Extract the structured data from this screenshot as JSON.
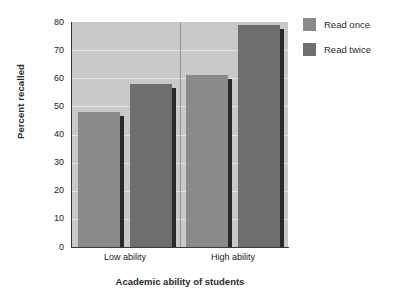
{
  "chart_data": {
    "type": "bar",
    "title": "",
    "subtitle": "",
    "xlabel": "Academic ability of students",
    "ylabel": "Percent recalled",
    "categories": [
      "Low ability",
      "High ability"
    ],
    "series": [
      {
        "name": "Read once",
        "values": [
          48,
          61
        ],
        "color": "#8a8a8a"
      },
      {
        "name": "Read twice",
        "values": [
          58,
          79
        ],
        "color": "#6e6e6e"
      }
    ],
    "ylim": [
      0,
      80
    ],
    "ytick_values": [
      0,
      10,
      20,
      30,
      40,
      50,
      60,
      70,
      80
    ],
    "ytick_labels": [
      "0",
      "10",
      "20",
      "30",
      "40",
      "50",
      "60",
      "70",
      "80"
    ],
    "grid": true,
    "grid_axis": "y",
    "legend_position": "right",
    "plot_background": "#c9c9c9",
    "gridline_color": "#e6e6e6",
    "axis_color": "#3a3a3a",
    "shadow_color": "#2a2a2a",
    "group_divider": true,
    "bars": [
      {
        "group": "Low ability",
        "series": "Read once",
        "value": 48,
        "color": "#8a8a8a"
      },
      {
        "group": "Low ability",
        "series": "Read twice",
        "value": 58,
        "color": "#6e6e6e"
      },
      {
        "group": "High ability",
        "series": "Read once",
        "value": 61,
        "color": "#8a8a8a"
      },
      {
        "group": "High ability",
        "series": "Read twice",
        "value": 79,
        "color": "#6e6e6e"
      }
    ]
  },
  "legend": {
    "items": [
      {
        "label": "Read once",
        "color": "#8a8a8a",
        "icon": "legend-swatch-icon"
      },
      {
        "label": "Read twice",
        "color": "#6e6e6e",
        "icon": "legend-swatch-icon"
      }
    ]
  }
}
